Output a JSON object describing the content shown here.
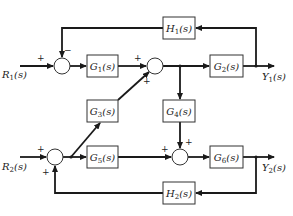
{
  "diagram": {
    "type": "block-diagram",
    "inputs": {
      "r1": {
        "label": "R",
        "sub": "1",
        "arg": "(s)"
      },
      "r2": {
        "label": "R",
        "sub": "2",
        "arg": "(s)"
      }
    },
    "outputs": {
      "y1": {
        "label": "Y",
        "sub": "1",
        "arg": "(s)"
      },
      "y2": {
        "label": "Y",
        "sub": "2",
        "arg": "(s)"
      }
    },
    "blocks": {
      "g1": {
        "label": "G",
        "sub": "1",
        "arg": "(s)"
      },
      "g2": {
        "label": "G",
        "sub": "2",
        "arg": "(s)"
      },
      "g3": {
        "label": "G",
        "sub": "3",
        "arg": "(s)"
      },
      "g4": {
        "label": "G",
        "sub": "4",
        "arg": "(s)"
      },
      "g5": {
        "label": "G",
        "sub": "5",
        "arg": "(s)"
      },
      "g6": {
        "label": "G",
        "sub": "6",
        "arg": "(s)"
      },
      "h1": {
        "label": "H",
        "sub": "1",
        "arg": "(s)"
      },
      "h2": {
        "label": "H",
        "sub": "2",
        "arg": "(s)"
      }
    },
    "signs": {
      "s1_input": "+",
      "s1_feedback": "−",
      "s2_input": "+",
      "s2_g3": "+",
      "s3_input": "+",
      "s3_feedback": "+",
      "s4_input": "+",
      "s4_g4": "+"
    },
    "connections": [
      "R1 → S1(+)",
      "S1 → G1 → S2(+)",
      "S2 → G2 → Y1",
      "Y1 → H1 → S1(−)",
      "S2 output → G4 → S4(+)",
      "R2 → S3(+)",
      "S3 → G5 → S4(+)",
      "S3 output → G3 → S2(+)",
      "S4 → G6 → Y2",
      "Y2 → H2 → S3(+)"
    ]
  }
}
